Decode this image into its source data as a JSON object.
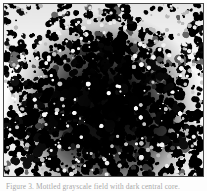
{
  "figure": {
    "kind": "grayscale-micrograph-panel",
    "caption": "Figure 3. Mottled grayscale field with dark central core.",
    "caption_visible_state": "clipped",
    "panel": {
      "border_color": "#4a4a4a",
      "background_color": "#0b0b0b",
      "page_background": "#fdfdfd"
    },
    "colors": {
      "darkest": "#000000",
      "dark": "#101010",
      "mid_gray": "#6e6e6e",
      "light_gray": "#c9c9c9",
      "lightest": "#ffffff",
      "caption_text": "#a8a8a8"
    },
    "texture": {
      "description": "High-contrast speckled black-and-white mottling, coarse blob grain, densest and darkest toward the centre and fading to bright white patches at the upper-left and upper-right corners.",
      "grain_blob_count": 2100,
      "grain_radius_min": 1.2,
      "grain_radius_max": 7.5,
      "contrast": "high",
      "seed": 20240607
    },
    "core": {
      "label": "dark central core",
      "center_x_pct": 51,
      "center_y_pct": 62,
      "radius_x_pct": 41,
      "radius_y_pct": 38,
      "intensity": "near-black"
    },
    "bright_patches": [
      {
        "name": "upper-left-highlight",
        "x_pct": 17,
        "y_pct": 12,
        "radius_pct": 20
      },
      {
        "name": "upper-right-highlight",
        "x_pct": 80,
        "y_pct": 10,
        "radius_pct": 18
      },
      {
        "name": "top-center-highlight",
        "x_pct": 47,
        "y_pct": 6,
        "radius_pct": 13
      },
      {
        "name": "right-edge-highlight",
        "x_pct": 95,
        "y_pct": 47,
        "radius_pct": 12
      },
      {
        "name": "lower-right-highlight",
        "x_pct": 78,
        "y_pct": 92,
        "radius_pct": 14
      },
      {
        "name": "left-edge-highlight",
        "x_pct": 4,
        "y_pct": 58,
        "radius_pct": 11
      }
    ]
  }
}
